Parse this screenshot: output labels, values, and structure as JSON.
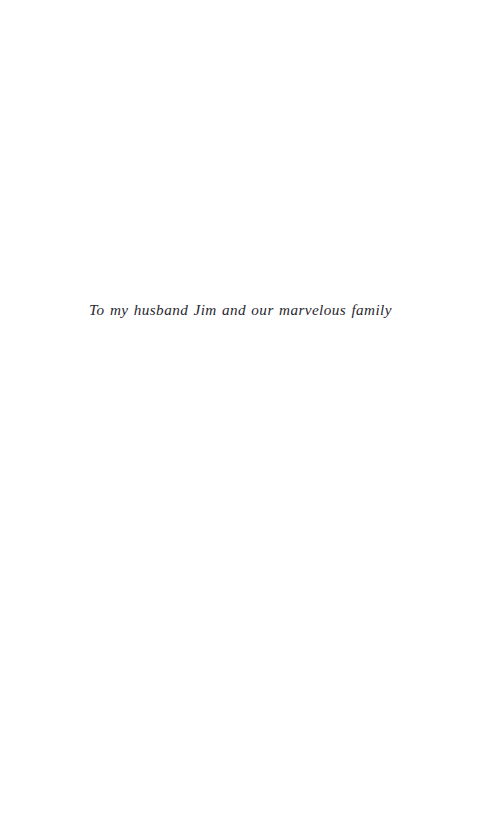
{
  "page": {
    "kind": "book-dedication-page",
    "background_color": "#ffffff",
    "ink_color": "#272730",
    "width_px": 481,
    "height_px": 814
  },
  "dedication": {
    "text": "To my husband Jim and our marvelous family",
    "style": "italic",
    "alignment": "center",
    "baseline_y_px": 318
  }
}
